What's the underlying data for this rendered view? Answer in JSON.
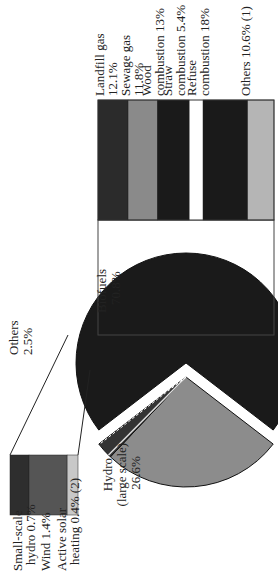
{
  "chart_data": {
    "type": "pie",
    "title": "",
    "orientation": "rotated 90° counter-clockwise",
    "pie": {
      "slices": [
        {
          "label": "Biofuels",
          "value": 70.8,
          "value_label": "70.8%",
          "color": "#1a1a1a",
          "exploded": true
        },
        {
          "label": "Hydro (large scale)",
          "value": 26.6,
          "value_label": "26.6%",
          "color": "#8c8c8c",
          "exploded": false
        },
        {
          "label": "Others",
          "value": 2.5,
          "value_label": "2.5%",
          "color": "#333333",
          "exploded": false
        }
      ]
    },
    "biofuels_breakdown": {
      "type": "stacked-bar",
      "segments": [
        {
          "label": "Landfill gas",
          "value": 12.1,
          "value_label": "12.1%",
          "color": "#2b2b2b"
        },
        {
          "label": "Sewage gas",
          "value": 11.8,
          "value_label": "11.8%",
          "color": "#8a8a8a"
        },
        {
          "label": "Wood combustion",
          "value": 13.0,
          "value_label": "13%",
          "color": "#1a1a1a"
        },
        {
          "label": "Straw combustion",
          "value": 5.4,
          "value_label": "5.4%",
          "color": "#ffffff"
        },
        {
          "label": "Refuse combustion",
          "value": 18.0,
          "value_label": "18%",
          "color": "#1a1a1a"
        },
        {
          "label": "Others",
          "value": 10.6,
          "value_label": "10.6%",
          "note": "(1)",
          "color": "#b5b5b5"
        }
      ]
    },
    "others_breakdown": {
      "type": "stacked-bar",
      "segments": [
        {
          "label": "Small-scale hydro",
          "value": 0.7,
          "value_label": "0.7%",
          "color": "#2e2e2e"
        },
        {
          "label": "Wind",
          "value": 1.4,
          "value_label": "1.4%",
          "color": "#555555"
        },
        {
          "label": "Active solar heating",
          "value": 0.4,
          "value_label": "0.4%",
          "note": "(2)",
          "color": "#c8c8c8"
        }
      ]
    }
  },
  "labels": {
    "biofuels": [
      "Biofuels",
      "70.8%"
    ],
    "hydro": [
      "Hydro",
      "(large scale)",
      "26.6%"
    ],
    "others": [
      "Others",
      "2.5%"
    ],
    "bio_segments": [
      [
        "Landfill gas",
        "12.1%"
      ],
      [
        "Sewage gas",
        "11.8%"
      ],
      [
        "Wood",
        "combustion 13%"
      ],
      [
        "Straw",
        "combustion 5.4%"
      ],
      [
        "Refuse",
        "combustion 18%"
      ],
      [
        "Others 10.6% (1)"
      ]
    ],
    "other_segments": [
      [
        "Small-scale",
        "hydro 0.7%"
      ],
      [
        "Wind 1.4%"
      ],
      [
        "Active solar",
        "heating 0.4% (2)"
      ]
    ]
  }
}
